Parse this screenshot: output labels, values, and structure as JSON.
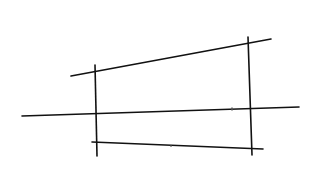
{
  "canvas": {
    "width": 317,
    "height": 182,
    "background": "#ffffff",
    "ink_color": "#111111"
  },
  "diagram": {
    "lines": [
      {
        "id": "top-line",
        "x1": 71,
        "y1": 76,
        "x2": 271,
        "y2": 39
      },
      {
        "id": "middle-line",
        "x1": 22,
        "y1": 116,
        "x2": 299,
        "y2": 107
      },
      {
        "id": "bottom-line",
        "x1": 92,
        "y1": 142,
        "x2": 263,
        "y2": 149
      },
      {
        "id": "left-vertical-line",
        "x1": 95,
        "y1": 65,
        "x2": 97,
        "y2": 156
      },
      {
        "id": "right-vertical-line",
        "x1": 248,
        "y1": 37,
        "x2": 252,
        "y2": 155
      }
    ],
    "marks": [
      {
        "id": "tick-mark-middle-right",
        "x": 232,
        "y": 109
      },
      {
        "id": "tick-mark-bottom-center",
        "x": 171,
        "y": 146
      }
    ]
  }
}
